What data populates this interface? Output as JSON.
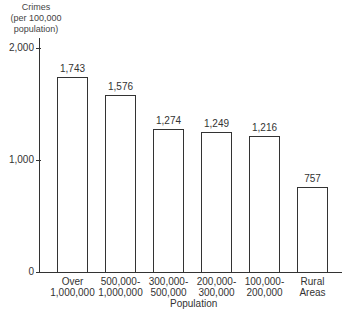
{
  "chart_data": {
    "type": "bar",
    "title": "",
    "ylabel": "Crimes (per 100,000 population)",
    "ylabel_lines": [
      "Crimes",
      "(per 100,000",
      "population)"
    ],
    "xlabel": "Population",
    "ylim": [
      0,
      2000
    ],
    "yticks": [
      "0",
      "1,000",
      "2,000"
    ],
    "categories": [
      "Over 1,000,000",
      "500,000-1,000,000",
      "300,000-500,000",
      "200,000-300,000",
      "100,000-200,000",
      "Rural Areas"
    ],
    "category_lines": [
      [
        "Over",
        "1,000,000"
      ],
      [
        "500,000-",
        "1,000,000"
      ],
      [
        "300,000-",
        "500,000"
      ],
      [
        "200,000-",
        "300,000"
      ],
      [
        "100,000-",
        "200,000"
      ],
      [
        "Rural",
        "Areas"
      ]
    ],
    "values": [
      1743,
      1576,
      1274,
      1249,
      1216,
      757
    ],
    "value_labels": [
      "1,743",
      "1,576",
      "1,274",
      "1,249",
      "1,216",
      "757"
    ],
    "grid": false,
    "legend": null
  }
}
